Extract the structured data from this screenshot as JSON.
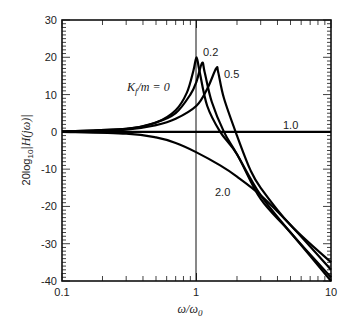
{
  "chart_data": {
    "type": "line",
    "title": "",
    "xlabel": "ω/ω0",
    "ylabel": "20log10|H(jω)|",
    "xscale": "log",
    "xlim": [
      0.1,
      10
    ],
    "ylim": [
      -40,
      30
    ],
    "x_ticks": [
      "0.1",
      "1",
      "10"
    ],
    "y_ticks": [
      "30",
      "20",
      "10",
      "0",
      "-10",
      "-20",
      "-30",
      "-40"
    ],
    "grid": false,
    "reference_line_x": 1,
    "series": [
      {
        "name": "Kf/m = 0",
        "label": "Kf/m = 0",
        "x": [
          0.1,
          0.3,
          0.5,
          0.7,
          0.85,
          0.95,
          1.0,
          1.05,
          1.2,
          1.5,
          2,
          3,
          5,
          10
        ],
        "values": [
          0.1,
          0.8,
          2.5,
          5.8,
          10.6,
          16.5,
          20,
          16.5,
          7,
          0,
          -6,
          -18,
          -27,
          -40
        ]
      },
      {
        "name": "0.2",
        "label": "0.2",
        "x": [
          0.1,
          0.3,
          0.5,
          0.7,
          0.9,
          1.0,
          1.1,
          1.15,
          1.3,
          1.6,
          2,
          3,
          5,
          10
        ],
        "values": [
          0.1,
          0.8,
          2.5,
          5,
          10,
          13.5,
          18.5,
          16,
          8,
          0,
          -6,
          -17,
          -27,
          -39
        ]
      },
      {
        "name": "0.5",
        "label": "0.5",
        "x": [
          0.1,
          0.3,
          0.5,
          0.7,
          1.0,
          1.2,
          1.4,
          1.45,
          1.6,
          2,
          2.5,
          3,
          5,
          10
        ],
        "values": [
          0.1,
          0.6,
          1.8,
          3.5,
          7,
          11.5,
          17,
          16,
          9,
          -1,
          -10,
          -15,
          -25,
          -35
        ]
      },
      {
        "name": "1.0",
        "label": "1.0",
        "x": [
          0.1,
          1,
          10
        ],
        "values": [
          0,
          0,
          0
        ]
      },
      {
        "name": "2.0",
        "label": "2.0",
        "x": [
          0.1,
          0.3,
          0.5,
          0.7,
          1,
          1.5,
          2,
          3,
          5,
          10
        ],
        "values": [
          0,
          -0.5,
          -1.5,
          -3,
          -5.5,
          -9,
          -12,
          -17,
          -25,
          -37
        ]
      }
    ]
  },
  "axes": {
    "xlabel_main": "ω/ω",
    "xlabel_sub": "0",
    "ylabel_prefix": "20log",
    "ylabel_sub": "10",
    "ylabel_expr": "|H(jω)|"
  },
  "annotations": {
    "k0": "K",
    "k0_sub": "f",
    "k0_rest": "/m = 0",
    "k02": "0.2",
    "k05": "0.5",
    "k10": "1.0",
    "k20": "2.0"
  }
}
